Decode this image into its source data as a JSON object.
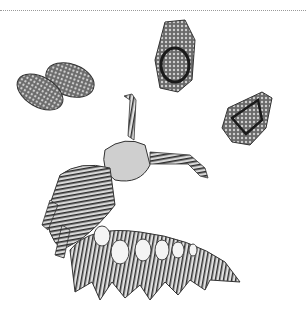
{
  "figure": {
    "background": "#ffffff",
    "ink": "#2a2a2a",
    "elements": [
      {
        "name": "egg-pair",
        "position": [
          55,
          90
        ]
      },
      {
        "name": "egg-top",
        "position": [
          175,
          55
        ]
      },
      {
        "name": "egg-right",
        "position": [
          245,
          118
        ]
      },
      {
        "name": "caterpillar",
        "position": [
          130,
          210
        ]
      }
    ]
  }
}
